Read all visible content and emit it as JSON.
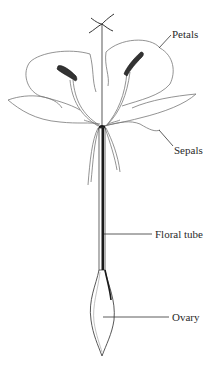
{
  "diagram": {
    "labels": [
      {
        "id": "petals",
        "text": "Petals"
      },
      {
        "id": "sepals",
        "text": "Sepals"
      },
      {
        "id": "floral_tube",
        "text": "Floral tube"
      },
      {
        "id": "ovary",
        "text": "Ovary"
      }
    ],
    "colors": {
      "line": "#555555",
      "dark": "#1a1a1a",
      "background": "#ffffff"
    }
  }
}
